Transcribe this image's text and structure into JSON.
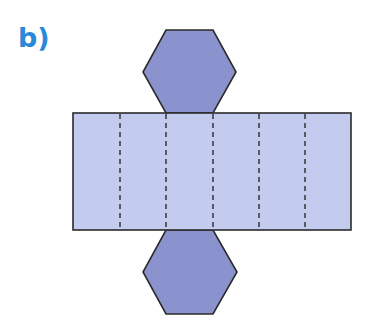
{
  "label": "b)",
  "colors": {
    "label": "#2a8ad8",
    "hexagon_fill": "#8b93cf",
    "rectangle_fill": "#c3ccef",
    "stroke": "#2b2b2b"
  },
  "figure": {
    "type": "net of hexagonal prism",
    "rectangle_faces": 6,
    "hexagon_faces": 2
  }
}
